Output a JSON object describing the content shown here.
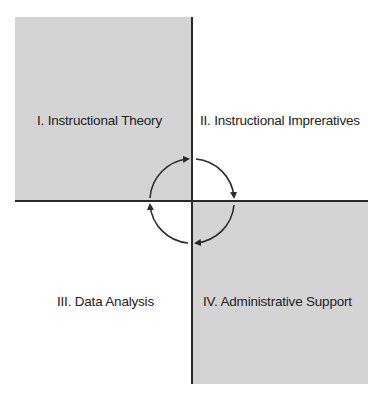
{
  "diagram": {
    "type": "quadrant",
    "quadrants": [
      {
        "id": "I",
        "label": "I. Instructional Theory",
        "position": "top-left",
        "shaded": true
      },
      {
        "id": "II",
        "label": "II. Instructional Impreratives",
        "position": "top-right",
        "shaded": false
      },
      {
        "id": "III",
        "label": "III. Data Analysis",
        "position": "bottom-left",
        "shaded": false
      },
      {
        "id": "IV",
        "label": "IV. Administrative Support",
        "position": "bottom-right",
        "shaded": true
      }
    ],
    "cycle": {
      "direction": "clockwise",
      "arrows": 4
    },
    "colors": {
      "shade": "#d4d4d4",
      "axis": "#2a2a2a",
      "text": "#222222"
    }
  }
}
